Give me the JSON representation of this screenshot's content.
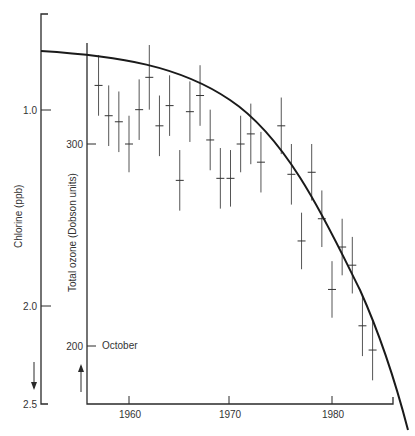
{
  "chart_data": {
    "type": "scatter",
    "title": "",
    "xlabel": "",
    "x_ticks": [
      "1960",
      "1970",
      "1980"
    ],
    "xlim": [
      1955.8,
      1985.8
    ],
    "axes": {
      "chlorine": {
        "label": "Chlorine (ppb)",
        "ticks": [
          "1.0",
          "2.0",
          "2.5"
        ],
        "tick_values": [
          1.0,
          2.0,
          2.5
        ],
        "direction": "inverted (increases downward)",
        "arrow": "down"
      },
      "ozone": {
        "label": "Total ozone (Dobson units)",
        "ticks": [
          "300",
          "200"
        ],
        "tick_values": [
          300,
          200
        ],
        "annotation": "October",
        "arrow": "up"
      }
    },
    "series": [
      {
        "name": "Total ozone (October), Dobson units",
        "kind": "points_with_error_bars",
        "points": [
          {
            "x": 1957,
            "y": 329,
            "err": 15
          },
          {
            "x": 1958,
            "y": 314,
            "err": 15
          },
          {
            "x": 1959,
            "y": 311,
            "err": 15
          },
          {
            "x": 1960,
            "y": 300,
            "err": 14
          },
          {
            "x": 1961,
            "y": 317,
            "err": 15
          },
          {
            "x": 1962,
            "y": 333,
            "err": 16
          },
          {
            "x": 1963,
            "y": 309,
            "err": 15
          },
          {
            "x": 1964,
            "y": 319,
            "err": 15
          },
          {
            "x": 1965,
            "y": 282,
            "err": 15
          },
          {
            "x": 1966,
            "y": 316,
            "err": 15
          },
          {
            "x": 1967,
            "y": 324,
            "err": 15
          },
          {
            "x": 1968,
            "y": 302,
            "err": 15
          },
          {
            "x": 1969,
            "y": 283,
            "err": 15
          },
          {
            "x": 1970,
            "y": 283,
            "err": 14
          },
          {
            "x": 1971,
            "y": 300,
            "err": 14
          },
          {
            "x": 1972,
            "y": 305,
            "err": 15
          },
          {
            "x": 1973,
            "y": 291,
            "err": 15
          },
          {
            "x": 1975,
            "y": 309,
            "err": 14
          },
          {
            "x": 1976,
            "y": 285,
            "err": 15
          },
          {
            "x": 1977,
            "y": 252,
            "err": 14
          },
          {
            "x": 1978,
            "y": 286,
            "err": 14
          },
          {
            "x": 1979,
            "y": 263,
            "err": 14
          },
          {
            "x": 1980,
            "y": 228,
            "err": 14
          },
          {
            "x": 1981,
            "y": 249,
            "err": 14
          },
          {
            "x": 1982,
            "y": 240,
            "err": 14
          },
          {
            "x": 1983,
            "y": 210,
            "err": 15
          },
          {
            "x": 1984,
            "y": 198,
            "err": 15
          }
        ]
      },
      {
        "name": "Chlorine (ppb), smooth curve",
        "kind": "line",
        "points": [
          {
            "x": 1952,
            "y": 0.6
          },
          {
            "x": 1956,
            "y": 0.63
          },
          {
            "x": 1960,
            "y": 0.67
          },
          {
            "x": 1964,
            "y": 0.74
          },
          {
            "x": 1968,
            "y": 0.84
          },
          {
            "x": 1972,
            "y": 1.0
          },
          {
            "x": 1975,
            "y": 1.17
          },
          {
            "x": 1978,
            "y": 1.42
          },
          {
            "x": 1981,
            "y": 1.75
          },
          {
            "x": 1984,
            "y": 2.14
          },
          {
            "x": 1987,
            "y": 2.62
          }
        ]
      }
    ],
    "grid": false,
    "legend": "none"
  },
  "labels": {
    "chlorine_axis_title": "Chlorine (ppb)",
    "ozone_axis_title": "Total ozone (Dobson units)",
    "october": "October",
    "cl_tick_1": "1.0",
    "cl_tick_2": "2.0",
    "cl_tick_3": "2.5",
    "oz_tick_300": "300",
    "oz_tick_200": "200",
    "x_tick_1960": "1960",
    "x_tick_1970": "1970",
    "x_tick_1980": "1980"
  },
  "colors": {
    "curve": "#1a1a1a",
    "axes": "#2a2a2a",
    "error_bars": "#555555",
    "text": "#333333"
  }
}
